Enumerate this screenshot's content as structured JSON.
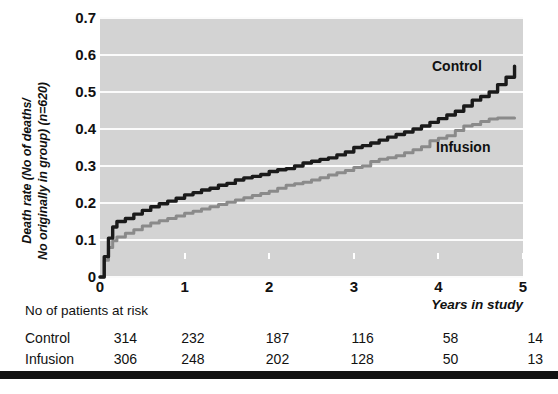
{
  "axes": {
    "y_label_line1": "Death rate (No of deaths/",
    "y_label_line2": "No originally in group) (n=620)",
    "x_title": "Years in study",
    "y_ticks": [
      "0.7",
      "0.6",
      "0.5",
      "0.4",
      "0.3",
      "0.2",
      "0.1",
      "0"
    ],
    "x_ticks": [
      "0",
      "1",
      "2",
      "3",
      "4",
      "5"
    ]
  },
  "series_labels": {
    "control": "Control",
    "infusion": "Infusion"
  },
  "risk_table": {
    "title": "No of patients at risk",
    "rows": [
      {
        "name": "Control",
        "values": [
          "314",
          "232",
          "187",
          "116",
          "58",
          "14"
        ]
      },
      {
        "name": "Infusion",
        "values": [
          "306",
          "248",
          "202",
          "128",
          "50",
          "13"
        ]
      }
    ]
  },
  "colors": {
    "control": "#1a1a1a",
    "infusion": "#8a8a8a",
    "plot_background": "#d3d3d3",
    "gridline": "#fbfbfb",
    "bottom_bar": "#111111"
  },
  "chart_data": {
    "type": "line",
    "title": "",
    "xlabel": "Years in study",
    "ylabel": "Death rate (No of deaths/No originally in group) (n=620)",
    "xlim": [
      0,
      5
    ],
    "ylim": [
      0,
      0.7
    ],
    "xticks": [
      0,
      1,
      2,
      3,
      4,
      5
    ],
    "yticks": [
      0,
      0.1,
      0.2,
      0.3,
      0.4,
      0.5,
      0.6,
      0.7
    ],
    "grid": "horizontal",
    "legend": "inline-annotations",
    "n_total": 620,
    "series": [
      {
        "name": "Control",
        "color": "#1a1a1a",
        "x": [
          0.0,
          0.05,
          0.1,
          0.15,
          0.2,
          0.3,
          0.4,
          0.5,
          0.6,
          0.7,
          0.8,
          0.9,
          1.0,
          1.1,
          1.2,
          1.3,
          1.4,
          1.5,
          1.6,
          1.7,
          1.8,
          1.9,
          2.0,
          2.1,
          2.2,
          2.3,
          2.4,
          2.5,
          2.6,
          2.7,
          2.8,
          2.9,
          3.0,
          3.1,
          3.2,
          3.3,
          3.4,
          3.5,
          3.6,
          3.7,
          3.8,
          3.9,
          4.0,
          4.1,
          4.2,
          4.3,
          4.4,
          4.5,
          4.6,
          4.7,
          4.8,
          4.9
        ],
        "y": [
          0.0,
          0.055,
          0.105,
          0.135,
          0.15,
          0.158,
          0.17,
          0.18,
          0.19,
          0.198,
          0.205,
          0.213,
          0.222,
          0.228,
          0.235,
          0.24,
          0.248,
          0.253,
          0.262,
          0.268,
          0.272,
          0.277,
          0.285,
          0.29,
          0.293,
          0.3,
          0.308,
          0.313,
          0.318,
          0.322,
          0.33,
          0.338,
          0.35,
          0.355,
          0.362,
          0.37,
          0.378,
          0.385,
          0.392,
          0.4,
          0.408,
          0.418,
          0.428,
          0.438,
          0.448,
          0.462,
          0.478,
          0.488,
          0.5,
          0.52,
          0.54,
          0.57
        ]
      },
      {
        "name": "Infusion",
        "color": "#8a8a8a",
        "x": [
          0.0,
          0.05,
          0.1,
          0.15,
          0.2,
          0.3,
          0.4,
          0.5,
          0.6,
          0.7,
          0.8,
          0.9,
          1.0,
          1.1,
          1.2,
          1.3,
          1.4,
          1.5,
          1.6,
          1.7,
          1.8,
          1.9,
          2.0,
          2.1,
          2.2,
          2.3,
          2.4,
          2.5,
          2.6,
          2.7,
          2.8,
          2.9,
          3.0,
          3.1,
          3.2,
          3.3,
          3.4,
          3.5,
          3.6,
          3.7,
          3.8,
          3.9,
          4.0,
          4.1,
          4.2,
          4.3,
          4.4,
          4.5,
          4.6,
          4.7,
          4.8,
          4.9
        ],
        "y": [
          0.0,
          0.045,
          0.08,
          0.098,
          0.108,
          0.118,
          0.128,
          0.138,
          0.146,
          0.152,
          0.158,
          0.165,
          0.172,
          0.178,
          0.184,
          0.19,
          0.196,
          0.202,
          0.208,
          0.214,
          0.22,
          0.226,
          0.232,
          0.24,
          0.248,
          0.252,
          0.256,
          0.262,
          0.268,
          0.276,
          0.282,
          0.288,
          0.296,
          0.3,
          0.312,
          0.318,
          0.322,
          0.328,
          0.336,
          0.344,
          0.352,
          0.368,
          0.375,
          0.382,
          0.396,
          0.408,
          0.412,
          0.42,
          0.427,
          0.43,
          0.43,
          0.43
        ]
      }
    ]
  }
}
